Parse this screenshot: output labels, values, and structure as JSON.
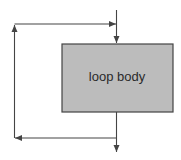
{
  "diagram": {
    "type": "flowchart-loop",
    "nodes": [
      {
        "id": "loop-body",
        "label": "loop body",
        "shape": "rectangle",
        "fill": "#bcbcbc",
        "stroke": "#444444"
      }
    ],
    "edges": [
      {
        "id": "entry",
        "from": "top",
        "to": "loop-body",
        "direction": "down"
      },
      {
        "id": "exit",
        "from": "loop-body",
        "to": "bottom",
        "direction": "down"
      },
      {
        "id": "loop-back",
        "from": "exit-line",
        "to": "entry-line",
        "path": "left-up-right"
      }
    ]
  },
  "colors": {
    "line": "#444444",
    "box_fill": "#bcbcbc",
    "background": "#ffffff"
  }
}
